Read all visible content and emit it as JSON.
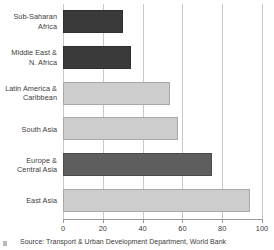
{
  "chart_data": {
    "type": "bar",
    "orientation": "horizontal",
    "title": "",
    "subtitle": "",
    "xlabel": "",
    "ylabel": "",
    "xlim": [
      0,
      100
    ],
    "ylim": null,
    "grid": true,
    "legend": null,
    "xticks": [
      "0",
      "20",
      "40",
      "60",
      "80",
      "100"
    ],
    "xtick_values": [
      0,
      20,
      40,
      60,
      80,
      100
    ],
    "categories": [
      "Sub-Saharan Africa",
      "Middle East & N. Africa",
      "Latin America & Caribbean",
      "South Asia",
      "Europe & Central Asia",
      "East Asia"
    ],
    "values": [
      30,
      34,
      54,
      58,
      75,
      94
    ],
    "bars": [
      {
        "label_line1": "Sub-Saharan",
        "label_line2": "Africa",
        "value": 30,
        "shade": "dark",
        "color": "#3a3a3a"
      },
      {
        "label_line1": "Middle East &",
        "label_line2": "N. Africa",
        "value": 34,
        "shade": "dark",
        "color": "#3a3a3a"
      },
      {
        "label_line1": "Latin America &",
        "label_line2": "Caribbean",
        "value": 54,
        "shade": "light",
        "color": "#cdcdcd"
      },
      {
        "label_line1": "South Asia",
        "label_line2": "",
        "value": 58,
        "shade": "light",
        "color": "#cdcdcd"
      },
      {
        "label_line1": "Europe &",
        "label_line2": "Central Asia",
        "value": 75,
        "shade": "mid",
        "color": "#5e5e5e"
      },
      {
        "label_line1": "East Asia",
        "label_line2": "",
        "value": 94,
        "shade": "light",
        "color": "#cdcdcd"
      }
    ]
  },
  "source": {
    "text": "Source: Transport & Urban Development Department, World Bank"
  },
  "colors": {
    "dark_bar": "#3a3a3a",
    "mid_bar": "#5e5e5e",
    "light_bar": "#cdcdcd",
    "gridline": "#c8c8c8",
    "axis": "#9a9a9a",
    "text": "#3d3d3d",
    "background": "#ffffff"
  }
}
